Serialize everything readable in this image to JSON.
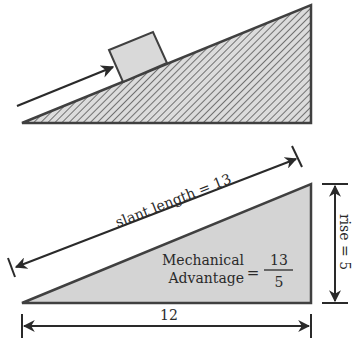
{
  "top_diagram": {
    "description": "inclined plane with block being pushed up the slope",
    "colors": {
      "stroke": "#404040",
      "hatch": "#555555",
      "block_fill": "#d9d9d9",
      "arrow": "#2a2a2a"
    }
  },
  "bottom_diagram": {
    "slant_label": "slant length = 13",
    "rise_label": "rise = 5",
    "run_label": "12",
    "ma_line1": "Mechanical",
    "ma_line2": "Advantage",
    "ma_equals": "=",
    "ma_numerator": "13",
    "ma_denominator": "5",
    "colors": {
      "stroke": "#404040",
      "fill": "#d4d4d4",
      "arrow": "#2a2a2a"
    }
  }
}
